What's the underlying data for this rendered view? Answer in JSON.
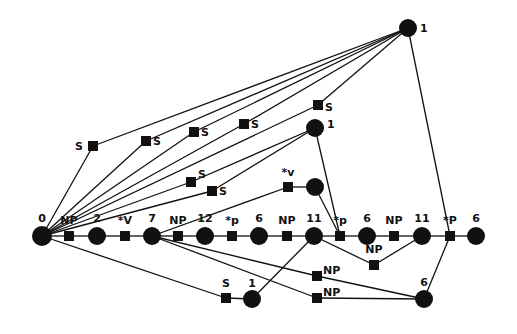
{
  "diagram": {
    "type": "parse-lattice",
    "node_types": {
      "circle": "state",
      "square": "arc-label"
    },
    "nodes": [
      {
        "id": "n0",
        "shape": "circle",
        "label": "0"
      },
      {
        "id": "a1",
        "shape": "square",
        "label": "NP"
      },
      {
        "id": "n2",
        "shape": "circle",
        "label": "2"
      },
      {
        "id": "a2",
        "shape": "square",
        "label": "*V"
      },
      {
        "id": "n7",
        "shape": "circle",
        "label": "7"
      },
      {
        "id": "a3",
        "shape": "square",
        "label": "NP"
      },
      {
        "id": "n12",
        "shape": "circle",
        "label": "12"
      },
      {
        "id": "a4",
        "shape": "square",
        "label": "*p"
      },
      {
        "id": "n6a",
        "shape": "circle",
        "label": "6"
      },
      {
        "id": "a5",
        "shape": "square",
        "label": "NP"
      },
      {
        "id": "n11a",
        "shape": "circle",
        "label": "11"
      },
      {
        "id": "a6",
        "shape": "square",
        "label": "*p"
      },
      {
        "id": "n6b",
        "shape": "circle",
        "label": "6"
      },
      {
        "id": "a7",
        "shape": "square",
        "label": "NP"
      },
      {
        "id": "n11b",
        "shape": "circle",
        "label": "11"
      },
      {
        "id": "a8",
        "shape": "square",
        "label": "*P"
      },
      {
        "id": "n6c",
        "shape": "circle",
        "label": "6"
      },
      {
        "id": "top1",
        "shape": "circle",
        "label": "1"
      },
      {
        "id": "s1",
        "shape": "square",
        "label": "S"
      },
      {
        "id": "s2",
        "shape": "square",
        "label": "S"
      },
      {
        "id": "s3",
        "shape": "square",
        "label": "S"
      },
      {
        "id": "s4",
        "shape": "square",
        "label": "S"
      },
      {
        "id": "s5",
        "shape": "square",
        "label": "S"
      },
      {
        "id": "mid1",
        "shape": "circle",
        "label": "1"
      },
      {
        "id": "s6",
        "shape": "square",
        "label": "S"
      },
      {
        "id": "s7",
        "shape": "square",
        "label": "S"
      },
      {
        "id": "av",
        "shape": "square",
        "label": "*v"
      },
      {
        "id": "nv",
        "shape": "circle",
        "label": ""
      },
      {
        "id": "np9",
        "shape": "square",
        "label": "NP"
      },
      {
        "id": "np10",
        "shape": "square",
        "label": "NP"
      },
      {
        "id": "np11",
        "shape": "square",
        "label": "NP"
      },
      {
        "id": "s8",
        "shape": "square",
        "label": "S"
      },
      {
        "id": "low1",
        "shape": "circle",
        "label": "1"
      },
      {
        "id": "low6",
        "shape": "circle",
        "label": "6"
      }
    ],
    "edges": [
      [
        "n0",
        "a1"
      ],
      [
        "a1",
        "n2"
      ],
      [
        "n2",
        "a2"
      ],
      [
        "a2",
        "n7"
      ],
      [
        "n7",
        "a3"
      ],
      [
        "a3",
        "n12"
      ],
      [
        "n12",
        "a4"
      ],
      [
        "a4",
        "n6a"
      ],
      [
        "n6a",
        "a5"
      ],
      [
        "a5",
        "n11a"
      ],
      [
        "n11a",
        "a6"
      ],
      [
        "a6",
        "n6b"
      ],
      [
        "n6b",
        "a7"
      ],
      [
        "a7",
        "n11b"
      ],
      [
        "n11b",
        "a8"
      ],
      [
        "a8",
        "n6c"
      ],
      [
        "n0",
        "s1"
      ],
      [
        "s1",
        "top1"
      ],
      [
        "n0",
        "s2"
      ],
      [
        "s2",
        "top1"
      ],
      [
        "n0",
        "s3"
      ],
      [
        "s3",
        "top1"
      ],
      [
        "n0",
        "s4"
      ],
      [
        "s4",
        "top1"
      ],
      [
        "n0",
        "s5"
      ],
      [
        "s5",
        "top1"
      ],
      [
        "top1",
        "a8"
      ],
      [
        "n0",
        "s6"
      ],
      [
        "s6",
        "mid1"
      ],
      [
        "n0",
        "s7"
      ],
      [
        "s7",
        "mid1"
      ],
      [
        "mid1",
        "a6"
      ],
      [
        "n7",
        "av"
      ],
      [
        "av",
        "nv"
      ],
      [
        "nv",
        "a6"
      ],
      [
        "n11a",
        "np9"
      ],
      [
        "np9",
        "n11b"
      ],
      [
        "n7",
        "np10"
      ],
      [
        "np10",
        "low6"
      ],
      [
        "n7",
        "np11"
      ],
      [
        "np11",
        "low6"
      ],
      [
        "n0",
        "s8"
      ],
      [
        "s8",
        "low1"
      ],
      [
        "low1",
        "n11a"
      ],
      [
        "a8",
        "low6"
      ]
    ]
  }
}
